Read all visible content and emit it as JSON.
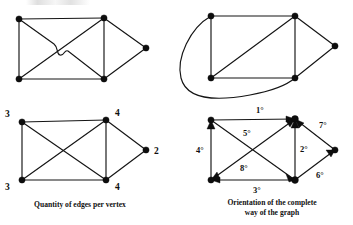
{
  "figure": {
    "background_color": "#ffffff",
    "ink_color": "#141414",
    "width": 353,
    "height": 225
  },
  "panels": {
    "top_left": {
      "name": "non-planar drawing with edge hop",
      "caption": "",
      "vertices": [
        {
          "id": "A",
          "x": 19,
          "y": 19,
          "label": ""
        },
        {
          "id": "B",
          "x": 104,
          "y": 18,
          "label": ""
        },
        {
          "id": "C",
          "x": 19,
          "y": 79,
          "label": ""
        },
        {
          "id": "D",
          "x": 104,
          "y": 79,
          "label": ""
        },
        {
          "id": "E",
          "x": 146,
          "y": 48,
          "label": ""
        }
      ],
      "edges": [
        {
          "from": "A",
          "to": "B",
          "style": "straight"
        },
        {
          "from": "A",
          "to": "C",
          "style": "straight"
        },
        {
          "from": "B",
          "to": "D",
          "style": "straight"
        },
        {
          "from": "C",
          "to": "D",
          "style": "straight"
        },
        {
          "from": "B",
          "to": "E",
          "style": "straight"
        },
        {
          "from": "D",
          "to": "E",
          "style": "straight"
        },
        {
          "from": "A",
          "to": "D",
          "style": "hop-over"
        },
        {
          "from": "C",
          "to": "B",
          "style": "straight"
        }
      ]
    },
    "top_right": {
      "name": "planar redrawing with external curved edge",
      "caption": "",
      "vertices": [
        {
          "id": "A",
          "x": 211,
          "y": 16,
          "label": ""
        },
        {
          "id": "B",
          "x": 295,
          "y": 16,
          "label": ""
        },
        {
          "id": "C",
          "x": 211,
          "y": 78,
          "label": ""
        },
        {
          "id": "D",
          "x": 295,
          "y": 78,
          "label": ""
        },
        {
          "id": "E",
          "x": 335,
          "y": 46,
          "label": ""
        }
      ],
      "edges": [
        {
          "from": "A",
          "to": "B",
          "style": "straight"
        },
        {
          "from": "A",
          "to": "C",
          "style": "straight"
        },
        {
          "from": "B",
          "to": "D",
          "style": "straight"
        },
        {
          "from": "C",
          "to": "D",
          "style": "straight"
        },
        {
          "from": "B",
          "to": "E",
          "style": "straight"
        },
        {
          "from": "D",
          "to": "E",
          "style": "straight"
        },
        {
          "from": "C",
          "to": "B",
          "style": "straight"
        },
        {
          "from": "A",
          "to": "D",
          "style": "curve-outside"
        }
      ]
    },
    "bottom_left": {
      "name": "degree labelled graph",
      "caption": "Quantity of edges per vertex",
      "vertices": [
        {
          "id": "A",
          "x": 22,
          "y": 122,
          "label": "3",
          "label_pos": "top-left"
        },
        {
          "id": "B",
          "x": 106,
          "y": 120,
          "label": "4",
          "label_pos": "top-right"
        },
        {
          "id": "C",
          "x": 22,
          "y": 180,
          "label": "3",
          "label_pos": "bottom-left"
        },
        {
          "id": "D",
          "x": 106,
          "y": 180,
          "label": "4",
          "label_pos": "bottom-right"
        },
        {
          "id": "E",
          "x": 146,
          "y": 150,
          "label": "2",
          "label_pos": "right"
        }
      ],
      "edges": [
        {
          "from": "A",
          "to": "B",
          "style": "straight"
        },
        {
          "from": "A",
          "to": "C",
          "style": "straight"
        },
        {
          "from": "B",
          "to": "D",
          "style": "straight"
        },
        {
          "from": "C",
          "to": "D",
          "style": "straight"
        },
        {
          "from": "B",
          "to": "E",
          "style": "straight"
        },
        {
          "from": "D",
          "to": "E",
          "style": "straight"
        },
        {
          "from": "A",
          "to": "D",
          "style": "straight"
        },
        {
          "from": "C",
          "to": "B",
          "style": "straight"
        }
      ]
    },
    "bottom_right": {
      "name": "oriented graph with edge traversal order",
      "caption_line_1": "Orientation of the complete",
      "caption_line_2": "way of the graph",
      "vertices": [
        {
          "id": "A",
          "x": 211,
          "y": 120,
          "label": ""
        },
        {
          "id": "B",
          "x": 295,
          "y": 119,
          "label": ""
        },
        {
          "id": "C",
          "x": 211,
          "y": 180,
          "label": ""
        },
        {
          "id": "D",
          "x": 295,
          "y": 180,
          "label": ""
        },
        {
          "id": "E",
          "x": 335,
          "y": 150,
          "label": ""
        }
      ],
      "directed_edges": [
        {
          "order": "1°",
          "from": "A",
          "to": "B",
          "label_x": 256,
          "label_y": 113
        },
        {
          "order": "2°",
          "from": "D",
          "to": "B",
          "label_x": 300,
          "label_y": 152
        },
        {
          "order": "3°",
          "from": "D",
          "to": "C",
          "label_x": 253,
          "label_y": 193
        },
        {
          "order": "4°",
          "from": "C",
          "to": "A",
          "label_x": 198,
          "label_y": 152
        },
        {
          "order": "5°",
          "from": "A",
          "to": "D",
          "label_x": 245,
          "label_y": 136
        },
        {
          "order": "6°",
          "from": "D",
          "to": "E",
          "label_x": 317,
          "label_y": 177
        },
        {
          "order": "7°",
          "from": "E",
          "to": "B",
          "label_x": 320,
          "label_y": 127
        },
        {
          "order": "8°",
          "from": "C",
          "to": "B",
          "label_x": 242,
          "label_y": 170
        }
      ],
      "order_labels": [
        "1°",
        "2°",
        "3°",
        "4°",
        "5°",
        "6°",
        "7°",
        "8°"
      ]
    }
  }
}
